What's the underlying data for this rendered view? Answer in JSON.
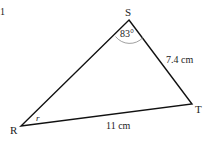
{
  "diagram": {
    "type": "triangle",
    "margin_mark": "1",
    "vertices": {
      "S": {
        "label": "S",
        "x": 129,
        "y": 20
      },
      "T": {
        "label": "T",
        "x": 192,
        "y": 104
      },
      "R": {
        "label": "R",
        "x": 21,
        "y": 126
      }
    },
    "angle_S": "83°",
    "angle_R": "r",
    "side_ST": "7.4 cm",
    "side_RT": "11 cm",
    "line_color": "#111111",
    "arc_color": "#888888"
  }
}
